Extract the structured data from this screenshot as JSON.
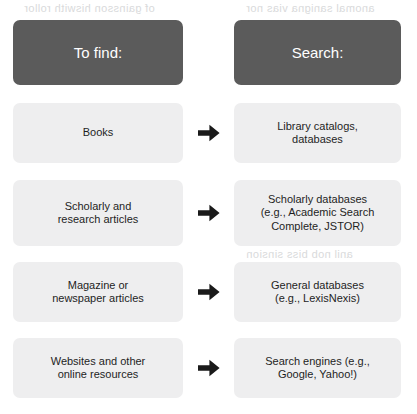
{
  "document": {
    "type": "reference-table",
    "title_implicit": "To find / Search reference table",
    "colors": {
      "header_fill": "#5b5b5b",
      "header_text": "#ffffff",
      "cell_fill": "#eeeeef",
      "cell_text": "#1e1e1e",
      "arrow": "#1a1a1a",
      "page_background": "#ffffff",
      "showthrough_text": "#d9dadb"
    }
  },
  "table": {
    "headers": {
      "left": "To find:",
      "right": "Search:"
    },
    "connector_icon": "arrow-right-icon",
    "rows": [
      {
        "to_find": "Books",
        "search": "Library catalogs,\ndatabases",
        "search_lines": [
          "Library catalogs,",
          "databases"
        ]
      },
      {
        "to_find": "Scholarly and\nresearch articles",
        "to_find_lines": [
          "Scholarly and",
          "research articles"
        ],
        "search": "Scholarly databases\n(e.g., Academic Search\nComplete, JSTOR)",
        "search_lines": [
          "Scholarly databases",
          "(e.g., Academic Search",
          "Complete, JSTOR)"
        ]
      },
      {
        "to_find": "Magazine or\nnewspaper articles",
        "to_find_lines": [
          "Magazine or",
          "newspaper articles"
        ],
        "search": "General databases\n(e.g., LexisNexis)",
        "search_lines": [
          "General databases",
          "(e.g., LexisNexis)"
        ]
      },
      {
        "to_find": "Websites and other\nonline resources",
        "to_find_lines": [
          "Websites and other",
          "online resources"
        ],
        "search": "Search engines (e.g.,\nGoogle, Yahoo!)",
        "search_lines": [
          "Search engines (e.g.,",
          "Google, Yahoo!)"
        ]
      }
    ]
  },
  "scan_artifacts": {
    "note": "faint mirrored show-through text from the reverse side of the page; not legible",
    "marks": [
      "of gainsson hiswith rollor",
      "anomal sanigna vias nor",
      "ter nu ed cars abril",
      "sair nue ai gribnit",
      "ad list drie sounivd",
      "anil nob biss sinsion",
      "ter abinuoz sonil no",
      "mons bns anigsonm",
      "ouhsg bnn stusilduq"
    ]
  }
}
